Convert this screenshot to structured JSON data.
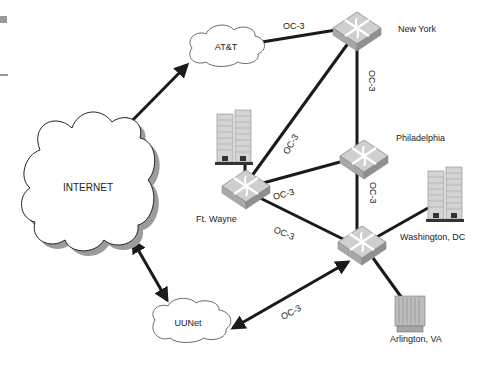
{
  "diagram": {
    "title": "",
    "clouds": [
      {
        "id": "internet",
        "label": "INTERNET"
      },
      {
        "id": "att",
        "label": "AT&T"
      },
      {
        "id": "uunet",
        "label": "UUNet"
      }
    ],
    "routers": [
      {
        "id": "new-york",
        "label": "New York"
      },
      {
        "id": "philadelphia",
        "label": "Philadelphia"
      },
      {
        "id": "ft-wayne",
        "label": "Ft. Wayne"
      },
      {
        "id": "washington-dc",
        "label": "Washington, DC"
      }
    ],
    "sites": [
      {
        "id": "arlington-va",
        "label": "Arlington, VA"
      }
    ],
    "links": [
      {
        "from": "att",
        "to": "new-york",
        "label": "OC-3"
      },
      {
        "from": "new-york",
        "to": "washington-dc",
        "label": "OC-3"
      },
      {
        "from": "new-york",
        "to": "ft-wayne",
        "label": "OC-3"
      },
      {
        "from": "ft-wayne",
        "to": "philadelphia",
        "label": "OC-3"
      },
      {
        "from": "ft-wayne",
        "to": "washington-dc",
        "label": "OC-3"
      },
      {
        "from": "philadelphia",
        "to": "washington-dc",
        "label": "OC-3"
      },
      {
        "from": "uunet",
        "to": "washington-dc",
        "label": "OC-3"
      },
      {
        "from": "internet",
        "to": "att",
        "label": ""
      },
      {
        "from": "internet",
        "to": "uunet",
        "label": ""
      },
      {
        "from": "washington-dc",
        "to": "arlington-va",
        "label": ""
      }
    ],
    "colors": {
      "line": "#1a1a1a",
      "router_top": "#c8c8c8",
      "router_side": "#9a9a9a",
      "building": "#bdbdbd",
      "cloud_shadow": "#9c9c9c"
    }
  }
}
